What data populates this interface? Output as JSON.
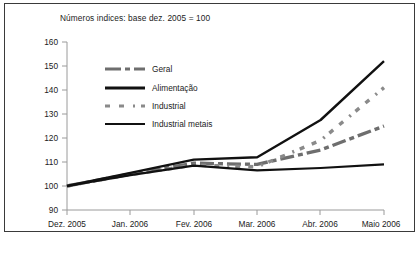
{
  "chart_data": {
    "type": "line",
    "title": "Números indices: base dez. 2005 = 100",
    "xlabel": "",
    "ylabel": "",
    "ylim": [
      90,
      160
    ],
    "yticks": [
      90,
      100,
      110,
      120,
      130,
      140,
      150,
      160
    ],
    "grid": false,
    "legend_position": "upper-left-inside",
    "categories": [
      "Dez. 2005",
      "Jan. 2006",
      "Fev. 2006",
      "Mar. 2006",
      "Abr. 2006",
      "Maio 2006"
    ],
    "series": [
      {
        "name": "Geral",
        "style": "dashed",
        "color": "#6e6e6e",
        "values": [
          100,
          105,
          109.5,
          109,
          115,
          125
        ]
      },
      {
        "name": "Alimentação",
        "style": "solid",
        "color": "#111111",
        "values": [
          100,
          104.5,
          108.5,
          106.5,
          107.5,
          109
        ]
      },
      {
        "name": "Industrial",
        "style": "dotted",
        "color": "#8a8a8a",
        "values": [
          100,
          104.8,
          108.7,
          108,
          119,
          141
        ]
      },
      {
        "name": "Industrial metais",
        "style": "solid",
        "color": "#111111",
        "values": [
          100,
          105.5,
          111,
          112,
          127.5,
          152
        ]
      }
    ]
  },
  "axis": {
    "y_tick_labels": [
      "160",
      "150",
      "140",
      "130",
      "120",
      "110",
      "100",
      "90"
    ],
    "x_tick_labels": [
      "Dez. 2005",
      "Jan. 2006",
      "Fev. 2006",
      "Mar. 2006",
      "Abr. 2006",
      "Maio 2006"
    ]
  },
  "legend": {
    "items": [
      {
        "label": "Geral"
      },
      {
        "label": "Alimentação"
      },
      {
        "label": "Industrial"
      },
      {
        "label": "Industrial metais"
      }
    ]
  }
}
